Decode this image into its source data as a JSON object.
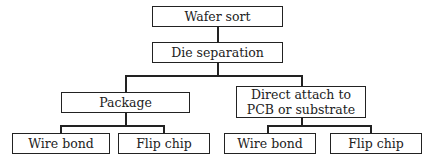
{
  "diagram": {
    "type": "flowchart-tree",
    "nodes": {
      "wafer_sort": "Wafer sort",
      "die_separation": "Die separation",
      "package": "Package",
      "direct_attach": "Direct attach to\nPCB or substrate",
      "package_wire_bond": "Wire bond",
      "package_flip_chip": "Flip chip",
      "direct_wire_bond": "Wire bond",
      "direct_flip_chip": "Flip chip"
    },
    "edges": [
      [
        "Wafer sort",
        "Die separation"
      ],
      [
        "Die separation",
        "Package"
      ],
      [
        "Die separation",
        "Direct attach to PCB or substrate"
      ],
      [
        "Package",
        "Wire bond"
      ],
      [
        "Package",
        "Flip chip"
      ],
      [
        "Direct attach to PCB or substrate",
        "Wire bond"
      ],
      [
        "Direct attach to PCB or substrate",
        "Flip chip"
      ]
    ],
    "colors": {
      "line": "#222222",
      "background": "#ffffff"
    }
  }
}
